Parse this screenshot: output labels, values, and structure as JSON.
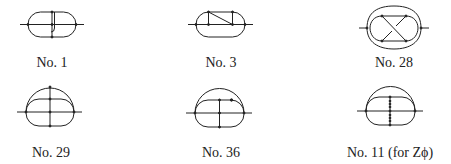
{
  "figure": {
    "panels": [
      {
        "id": "no1",
        "label": "No. 1",
        "label_x": 52,
        "label_y": 55
      },
      {
        "id": "no3",
        "label": "No. 3",
        "label_x": 221,
        "label_y": 55
      },
      {
        "id": "no28",
        "label": "No. 28",
        "label_x": 394,
        "label_y": 55
      },
      {
        "id": "no29",
        "label": "No. 29",
        "label_x": 51,
        "label_y": 145
      },
      {
        "id": "no36",
        "label": "No. 36",
        "label_x": 221,
        "label_y": 145
      },
      {
        "id": "no11",
        "label": "No. 11 (for Zϕ)",
        "label_x": 390,
        "label_y": 145
      }
    ],
    "stroke_color": "#222222",
    "background": "#ffffff"
  }
}
